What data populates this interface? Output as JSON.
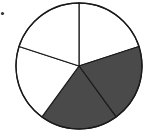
{
  "diagram": {
    "type": "fraction-pie",
    "total_parts": 5,
    "shaded_parts": 2,
    "fraction": "2/5",
    "colors": {
      "shaded": "#4a4a4a",
      "unshaded": "#ffffff",
      "stroke": "#1a1a1a",
      "bullet": "#333333"
    }
  },
  "chart_data": {
    "type": "pie",
    "categories": [
      "slice-1",
      "slice-2",
      "slice-3",
      "slice-4",
      "slice-5"
    ],
    "values": [
      1,
      1,
      1,
      1,
      1
    ],
    "shaded": [
      false,
      true,
      true,
      false,
      false
    ],
    "title": "",
    "legend": "none"
  }
}
